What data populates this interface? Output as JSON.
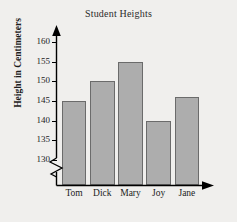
{
  "chart_data": {
    "type": "bar",
    "title": "Student Heights",
    "xlabel": "Students",
    "ylabel": "Height in Centimeters",
    "categories": [
      "Tom",
      "Dick",
      "Mary",
      "Joy",
      "Jane"
    ],
    "values": [
      145,
      150,
      155,
      140,
      146
    ],
    "ylim": [
      130,
      160
    ],
    "y_ticks": [
      130,
      135,
      140,
      145,
      150,
      155,
      160
    ],
    "y_tick_labels": [
      "130",
      "135",
      "140",
      "145",
      "150",
      "155",
      "160"
    ],
    "axis_break": true,
    "grid": false,
    "legend": null,
    "bar_fill_color": "#adadad",
    "bar_border_color": "#6b6b6b",
    "background_color": "#f0efed",
    "axis_color": "#000000"
  },
  "icons": {
    "y_axis_arrow": "up-arrow-icon",
    "x_axis_arrow": "right-arrow-icon",
    "axis_break": "zigzag-break-icon"
  }
}
